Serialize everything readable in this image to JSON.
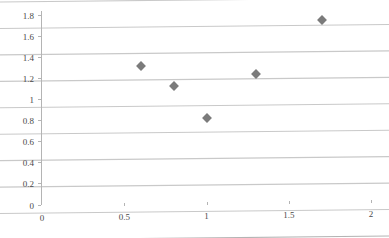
{
  "chart_data": {
    "type": "scatter",
    "title": "",
    "xlabel": "",
    "ylabel": "",
    "xlim": [
      0,
      2
    ],
    "ylim": [
      0,
      1.8
    ],
    "grid": true,
    "grid_axis": "y",
    "legend": "none",
    "marker": "diamond",
    "marker_color": "#7b7b7b",
    "grid_color": "#c9c9c9",
    "axis_color": "#b4b4b4",
    "label_color": "#4a4a4a",
    "x_ticks": [
      0,
      0.5,
      1,
      1.5,
      2
    ],
    "x_tick_labels": [
      "0",
      "0.5",
      "1",
      "1.5",
      "2"
    ],
    "y_ticks": [
      0,
      0.2,
      0.4,
      0.6,
      0.8,
      1,
      1.2,
      1.4,
      1.6,
      1.8
    ],
    "y_tick_labels": [
      "0",
      "0.2",
      "0.4",
      "0.6",
      "0.8",
      "1",
      "1.2",
      "1.4",
      "1.6",
      "1.8"
    ],
    "series": [
      {
        "name": "Series 1",
        "points": [
          {
            "x": 0.6,
            "y": 1.3
          },
          {
            "x": 0.8,
            "y": 1.11
          },
          {
            "x": 1.0,
            "y": 0.81
          },
          {
            "x": 1.3,
            "y": 1.22
          },
          {
            "x": 1.7,
            "y": 1.72
          }
        ]
      }
    ]
  }
}
